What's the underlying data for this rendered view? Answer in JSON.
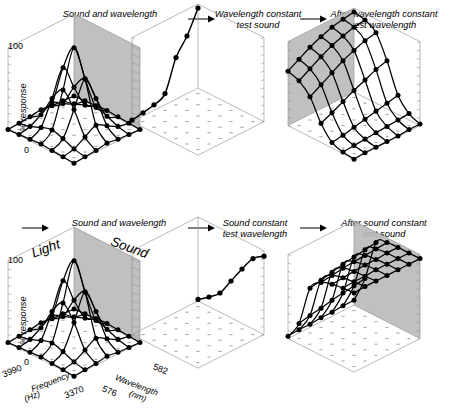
{
  "figure": {
    "title_row_top": [
      {
        "label": "Sound and wavelength"
      },
      {
        "label": "Wavelength constant\ntest sound"
      },
      {
        "label": "After wavelength constant\ntest wavelength"
      }
    ],
    "title_row_bottom": [
      {
        "label": "Sound and wavelength"
      },
      {
        "label": "Sound constant\ntest wavelength"
      },
      {
        "label": "After sound constant\ntest sound"
      }
    ],
    "arrow_glyph": "right-arrow"
  },
  "axes": {
    "y_label": "% response",
    "y_ticks": [
      "100",
      "0"
    ],
    "y_max": 100,
    "y_min": 0,
    "x_axis_name": "Frequency",
    "x_axis_units": "(Hz)",
    "x_ticks": [
      "3990",
      "3370"
    ],
    "z_axis_name": "Wavelength",
    "z_axis_units": "(nm)",
    "z_ticks": [
      "576",
      "582"
    ],
    "stimulus_labels": [
      "Light",
      "Sound"
    ]
  },
  "chart_data": [
    {
      "id": "p1",
      "type": "surface",
      "title": "Sound and wavelength",
      "xlabel": "Frequency (Hz)",
      "ylabel": "% response",
      "zlabel": "Wavelength (nm)",
      "xlim": [
        3370,
        3990
      ],
      "zlim": [
        576,
        582
      ],
      "ylim": [
        0,
        100
      ],
      "x": [
        3370,
        3474,
        3577,
        3680,
        3784,
        3887,
        3990
      ],
      "z": [
        576,
        577,
        578,
        579,
        580,
        581,
        582
      ],
      "grid": true,
      "legend": "none",
      "values": [
        [
          0,
          1,
          2,
          3,
          2,
          1,
          0
        ],
        [
          1,
          4,
          10,
          14,
          10,
          4,
          1
        ],
        [
          2,
          12,
          40,
          58,
          40,
          12,
          2
        ],
        [
          4,
          20,
          72,
          105,
          72,
          20,
          4
        ],
        [
          2,
          12,
          40,
          58,
          40,
          12,
          2
        ],
        [
          1,
          4,
          10,
          14,
          10,
          4,
          1
        ],
        [
          0,
          1,
          2,
          3,
          2,
          1,
          0
        ]
      ]
    },
    {
      "id": "p2",
      "type": "line",
      "title": "Wavelength constant test sound",
      "xlabel": "Frequency (Hz)",
      "ylabel": "% response",
      "xlim": [
        3370,
        3990
      ],
      "ylim": [
        0,
        100
      ],
      "x": [
        3370,
        3474,
        3577,
        3680,
        3784,
        3887,
        3990
      ],
      "values": [
        100,
        72,
        52,
        14,
        7,
        4,
        2
      ],
      "grid": false,
      "legend": "none"
    },
    {
      "id": "p3",
      "type": "surface",
      "title": "After wavelength constant test wavelength",
      "xlabel": "Frequency (Hz)",
      "ylabel": "% response",
      "zlabel": "Wavelength (nm)",
      "xlim": [
        3370,
        3990
      ],
      "zlim": [
        576,
        582
      ],
      "ylim": [
        0,
        100
      ],
      "x": [
        3370,
        3474,
        3577,
        3680,
        3784,
        3887,
        3990
      ],
      "z": [
        576,
        577,
        578,
        579,
        580,
        581,
        582
      ],
      "grid": true,
      "legend": "none",
      "values": [
        [
          100,
          97,
          88,
          60,
          24,
          8,
          2
        ],
        [
          98,
          95,
          85,
          56,
          21,
          7,
          2
        ],
        [
          95,
          91,
          80,
          50,
          18,
          6,
          1
        ],
        [
          90,
          86,
          74,
          44,
          15,
          5,
          1
        ],
        [
          84,
          79,
          66,
          37,
          12,
          4,
          1
        ],
        [
          76,
          71,
          58,
          30,
          9,
          3,
          1
        ],
        [
          68,
          63,
          50,
          24,
          7,
          2,
          0
        ]
      ]
    },
    {
      "id": "p4",
      "type": "surface",
      "title": "Sound and wavelength",
      "xlabel": "Frequency (Hz)",
      "ylabel": "% response",
      "zlabel": "Wavelength (nm)",
      "xlim": [
        3370,
        3990
      ],
      "zlim": [
        576,
        582
      ],
      "ylim": [
        0,
        100
      ],
      "x": [
        3370,
        3474,
        3577,
        3680,
        3784,
        3887,
        3990
      ],
      "z": [
        576,
        577,
        578,
        579,
        580,
        581,
        582
      ],
      "grid": true,
      "legend": "none",
      "values": [
        [
          0,
          1,
          2,
          3,
          2,
          1,
          0
        ],
        [
          1,
          4,
          10,
          14,
          10,
          4,
          1
        ],
        [
          2,
          12,
          40,
          58,
          40,
          12,
          2
        ],
        [
          4,
          20,
          72,
          105,
          72,
          20,
          4
        ],
        [
          2,
          12,
          40,
          58,
          40,
          12,
          2
        ],
        [
          1,
          4,
          10,
          14,
          10,
          4,
          1
        ],
        [
          0,
          1,
          2,
          3,
          2,
          1,
          0
        ]
      ]
    },
    {
      "id": "p5",
      "type": "line",
      "title": "Sound constant test wavelength",
      "xlabel": "Wavelength (nm)",
      "ylabel": "% response",
      "xlim": [
        576,
        582
      ],
      "ylim": [
        0,
        100
      ],
      "x": [
        576,
        577,
        578,
        579,
        580,
        581,
        582
      ],
      "values": [
        2,
        12,
        24,
        46,
        68,
        88,
        98
      ],
      "grid": false,
      "legend": "none"
    },
    {
      "id": "p6",
      "type": "surface",
      "title": "After sound constant test sound",
      "xlabel": "Frequency (Hz)",
      "ylabel": "% response",
      "zlabel": "Wavelength (nm)",
      "xlim": [
        3370,
        3990
      ],
      "zlim": [
        576,
        582
      ],
      "ylim": [
        0,
        100
      ],
      "x": [
        3370,
        3474,
        3577,
        3680,
        3784,
        3887,
        3990
      ],
      "z": [
        576,
        577,
        578,
        579,
        580,
        581,
        582
      ],
      "grid": true,
      "legend": "none",
      "values": [
        [
          6,
          40,
          92,
          99,
          100,
          100,
          100
        ],
        [
          6,
          38,
          90,
          98,
          100,
          100,
          100
        ],
        [
          5,
          36,
          88,
          97,
          99,
          100,
          100
        ],
        [
          5,
          34,
          86,
          96,
          99,
          100,
          100
        ],
        [
          4,
          31,
          83,
          95,
          98,
          99,
          100
        ],
        [
          4,
          29,
          80,
          93,
          97,
          99,
          100
        ],
        [
          3,
          26,
          77,
          91,
          96,
          98,
          99
        ]
      ]
    }
  ]
}
